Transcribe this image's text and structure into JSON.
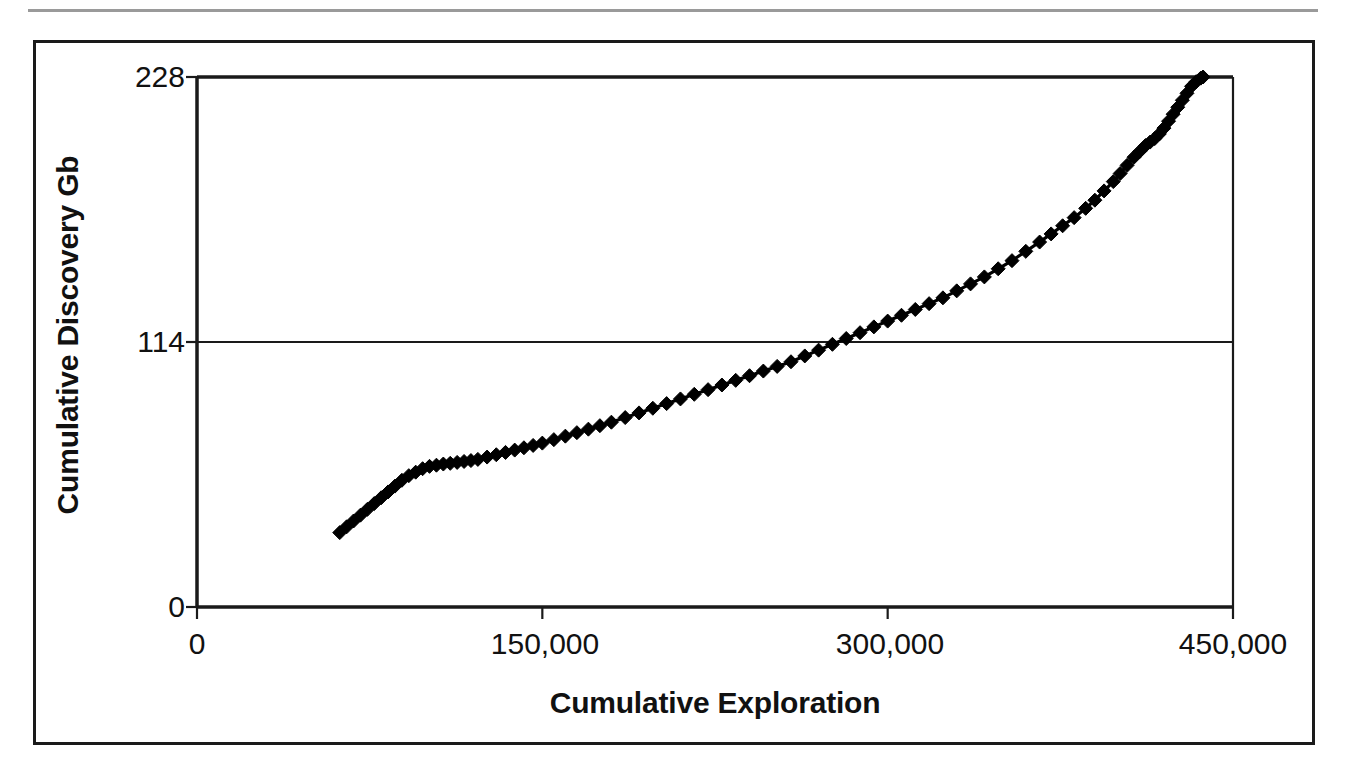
{
  "figure": {
    "background_color": "#ffffff",
    "frame_color": "#1a1a1a",
    "rule_color": "#9a9a9a"
  },
  "chart_data": {
    "type": "line",
    "title": "",
    "subtitle": "",
    "xlabel": "Cumulative Exploration",
    "ylabel": "Cumulative Discovery Gb",
    "xlim": [
      0,
      450000
    ],
    "ylim": [
      0,
      228
    ],
    "xticks": [
      0,
      150000,
      300000,
      450000
    ],
    "xtick_labels": [
      "0",
      "150,000",
      "300,000",
      "450,000"
    ],
    "yticks": [
      0,
      114,
      228
    ],
    "ytick_labels": [
      "0",
      "114",
      "228"
    ],
    "grid": "horizontal",
    "legend": "none",
    "marker": "diamond",
    "marker_color": "#000000",
    "line_color": "#000000",
    "series": [
      {
        "name": "Cumulative Discovery",
        "x": [
          62000,
          65000,
          68000,
          71000,
          74000,
          77000,
          80000,
          83000,
          86000,
          89000,
          92000,
          95000,
          98000,
          101000,
          104000,
          107000,
          110000,
          113000,
          116000,
          119000,
          122000,
          126000,
          130000,
          134000,
          138000,
          142000,
          146000,
          150000,
          155000,
          160000,
          165000,
          170000,
          175000,
          180000,
          186000,
          192000,
          198000,
          204000,
          210000,
          216000,
          222000,
          228000,
          234000,
          240000,
          246000,
          252000,
          258000,
          264000,
          270000,
          276000,
          282000,
          288000,
          294000,
          300000,
          306000,
          312000,
          318000,
          324000,
          330000,
          336000,
          342000,
          348000,
          354000,
          360000,
          366000,
          371000,
          376000,
          381000,
          386000,
          390000,
          394000,
          398000,
          401000,
          404000,
          407000,
          409500,
          412000,
          414000,
          416000,
          418000,
          420000,
          422000,
          424000,
          426000,
          428000,
          430000,
          432000,
          434000,
          436000,
          437000
        ],
        "y": [
          32.0,
          34.5,
          37.0,
          39.5,
          42.0,
          44.5,
          47.0,
          49.5,
          52.0,
          54.5,
          56.5,
          58.0,
          59.5,
          60.5,
          61.0,
          61.5,
          61.8,
          62.2,
          62.6,
          63.0,
          63.5,
          64.5,
          65.5,
          66.5,
          67.5,
          68.5,
          69.5,
          70.5,
          72.0,
          73.5,
          75.0,
          76.5,
          78.0,
          79.5,
          81.5,
          83.5,
          85.5,
          87.5,
          89.5,
          91.5,
          93.5,
          95.5,
          97.5,
          99.5,
          101.5,
          103.5,
          105.5,
          108.0,
          110.5,
          113.0,
          115.5,
          118.0,
          120.5,
          123.0,
          125.5,
          128.0,
          130.5,
          133.0,
          136.0,
          139.0,
          142.0,
          145.5,
          149.0,
          153.0,
          157.0,
          160.5,
          164.0,
          167.5,
          171.5,
          175.0,
          179.0,
          183.0,
          186.5,
          190.0,
          193.5,
          196.0,
          198.5,
          200.0,
          201.5,
          203.5,
          206.0,
          209.0,
          212.0,
          215.0,
          218.0,
          221.0,
          224.0,
          226.0,
          227.5,
          228.0
        ]
      }
    ]
  }
}
